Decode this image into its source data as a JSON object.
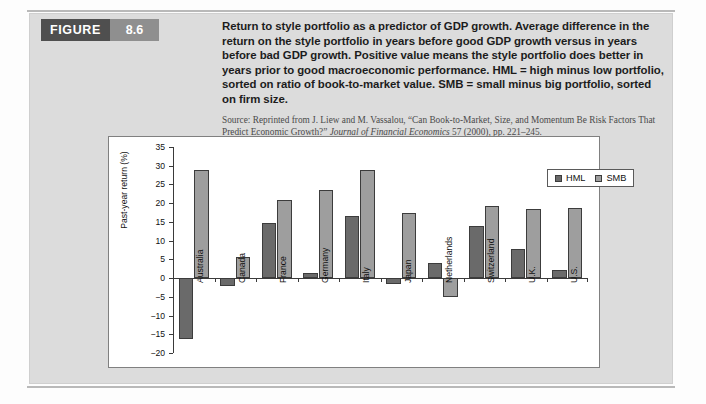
{
  "figure": {
    "word_label": "FIGURE",
    "number_label": "8.6"
  },
  "caption": {
    "main": "Return to style portfolio as a predictor of GDP growth. Average difference in the return on the style portfolio in years before good GDP growth versus in years before bad GDP growth. Positive value means the style portfolio does better in years prior to good macroeconomic performance. HML = high minus low portfolio, sorted on ratio of book-to-market value. SMB = small minus big portfolio, sorted on firm size.",
    "source_prefix": "Source: Reprinted from J. Liew and M. Vassalou, “Can Book-to-Market, Size, and Momentum Be Risk Factors That Predict Economic Growth?” ",
    "source_italic": "Journal of Financial Economics",
    "source_suffix": " 57 (2000), pp. 221–245."
  },
  "chart_data": {
    "type": "bar",
    "title": "",
    "xlabel": "",
    "ylabel": "Past-year return (%)",
    "ylim": [
      -20,
      35
    ],
    "ytick_step": 5,
    "yticks": [
      35,
      30,
      25,
      20,
      15,
      10,
      5,
      0,
      -5,
      -10,
      -15,
      -20
    ],
    "ytick_labels": [
      "35",
      "30",
      "25",
      "20",
      "15",
      "10",
      "5",
      "0",
      "−5",
      "−10",
      "−15",
      "−20"
    ],
    "grid": false,
    "legend_position": "top-right",
    "categories": [
      "Australia",
      "Canada",
      "France",
      "Germany",
      "Italy",
      "Japan",
      "Netherlands",
      "Switzerland",
      "U.K.",
      "U.S."
    ],
    "series": [
      {
        "name": "HML",
        "color": "#6a6a6a",
        "values": [
          -16.2,
          -2.0,
          14.8,
          1.3,
          16.6,
          -1.5,
          4.1,
          14.0,
          7.7,
          2.2
        ]
      },
      {
        "name": "SMB",
        "color": "#9e9e9e",
        "values": [
          28.8,
          5.6,
          20.8,
          23.5,
          28.8,
          17.4,
          -5.1,
          19.2,
          18.5,
          18.6
        ]
      }
    ]
  },
  "colors": {
    "panel_bg": "#dcdcdc",
    "figure_tag_dark": "#4f4f4f",
    "figure_tag_light": "#8f8f8f",
    "hml": "#6a6a6a",
    "smb": "#9e9e9e",
    "axis": "#3a3a3a"
  }
}
